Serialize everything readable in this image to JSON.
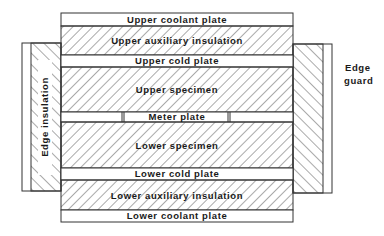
{
  "diagram": {
    "type": "guarded-hot-plate-cross-section",
    "layers": [
      {
        "id": "upper-coolant-plate",
        "label": "Upper coolant plate",
        "hatched": false,
        "y": 13,
        "h": 13
      },
      {
        "id": "upper-auxiliary-insulation",
        "label": "Upper auxiliary insulation",
        "hatched": true,
        "y": 26,
        "h": 29
      },
      {
        "id": "upper-cold-plate",
        "label": "Upper cold plate",
        "hatched": false,
        "y": 55,
        "h": 12
      },
      {
        "id": "upper-specimen",
        "label": "Upper specimen",
        "hatched": true,
        "y": 67,
        "h": 45
      },
      {
        "id": "meter-plate",
        "label": "Meter plate",
        "hatched": false,
        "y": 112,
        "h": 10
      },
      {
        "id": "lower-specimen",
        "label": "Lower specimen",
        "hatched": true,
        "y": 122,
        "h": 46
      },
      {
        "id": "lower-cold-plate",
        "label": "Lower cold plate",
        "hatched": false,
        "y": 168,
        "h": 12
      },
      {
        "id": "lower-auxiliary-insulation",
        "label": "Lower auxiliary insulation",
        "hatched": true,
        "y": 180,
        "h": 30
      },
      {
        "id": "lower-coolant-plate",
        "label": "Lower coolant plate",
        "hatched": false,
        "y": 210,
        "h": 12
      }
    ],
    "side_labels": {
      "edge_insulation": "Edge insulation",
      "edge_guard_line1": "Edge",
      "edge_guard_line2": "guard"
    },
    "colors": {
      "line": "#333333",
      "hatch": "#444444",
      "background": "#ffffff"
    }
  }
}
